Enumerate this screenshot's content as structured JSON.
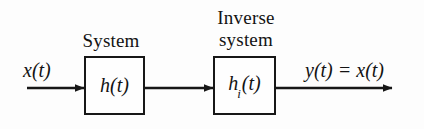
{
  "figure": {
    "background_color": "#fdfdfd",
    "stroke_color": "#171717",
    "text_color": "#131313",
    "width": 424,
    "height": 129
  },
  "captions": {
    "system_label": "System",
    "inverse_line1": "Inverse",
    "inverse_line2": "system"
  },
  "signals": {
    "input_label": "x(t)",
    "output_label": "y(t) = x(t)"
  },
  "blocks": [
    {
      "id": "system-block",
      "impulse_response": "h(t)",
      "symbol_base": "h",
      "symbol_subscript": "",
      "symbol_arg": "(t)",
      "caption": "System",
      "x": 84,
      "y": 56,
      "width": 61,
      "height": 59
    },
    {
      "id": "inverse-system-block",
      "impulse_response": "hi(t)",
      "symbol_base": "h",
      "symbol_subscript": "i",
      "symbol_arg": "(t)",
      "caption": "Inverse system",
      "x": 213,
      "y": 56,
      "width": 63,
      "height": 59
    }
  ],
  "arrows": [
    {
      "id": "input-arrow",
      "from_x": 27,
      "to_x": 84,
      "y": 88
    },
    {
      "id": "interconnect-arrow",
      "from_x": 145,
      "to_x": 213,
      "y": 88
    },
    {
      "id": "output-arrow",
      "from_x": 276,
      "to_x": 392,
      "y": 88
    }
  ]
}
